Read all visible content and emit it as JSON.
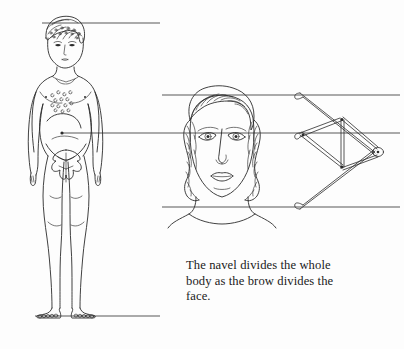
{
  "figure": {
    "background_color": "#fdfdfd",
    "ink_color": "#2b2b2b",
    "line_color": "#3a3a3a"
  },
  "caption": {
    "full_text": "The navel divides the whole body as the brow divides the face.",
    "lines": [
      "The navel divides the whole",
      "body as the brow divides the",
      "face."
    ]
  },
  "elements": {
    "standing_figure_label": "standing male nude figure",
    "head_figure_label": "frontal head with curly hair",
    "instrument_label": "proportional divider caliper",
    "fig_leaf_label": "fig leaf",
    "chest_hair_label": "chest hair spirals",
    "navel_label": "navel point"
  },
  "reference_lines": [
    {
      "name": "top-of-head-line",
      "y": 23,
      "x1": 42,
      "x2": 160
    },
    {
      "name": "navel-brow-line",
      "y": 133,
      "x1": 62,
      "x2": 400
    },
    {
      "name": "crown-of-head-line",
      "y": 95,
      "x1": 162,
      "x2": 400
    },
    {
      "name": "chin-line",
      "y": 207,
      "x1": 162,
      "x2": 400
    },
    {
      "name": "ground-baseline",
      "y": 316,
      "x1": 35,
      "x2": 160
    }
  ]
}
